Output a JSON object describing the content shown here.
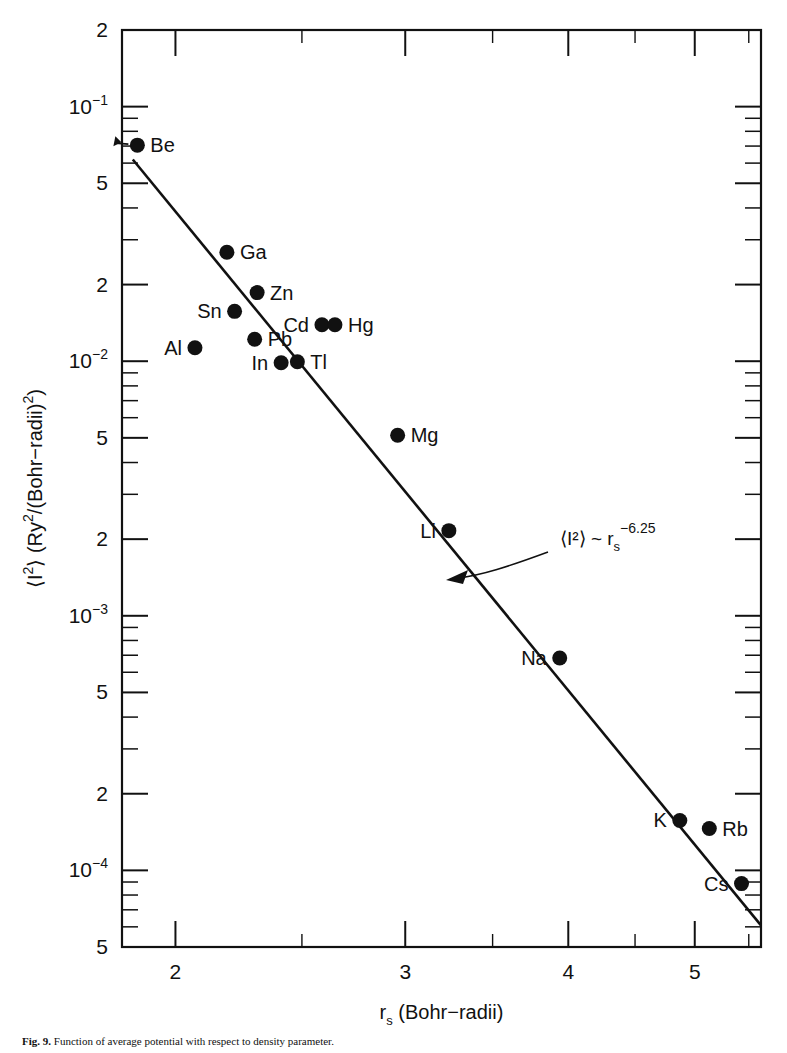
{
  "figure": {
    "caption_prefix": "Fig. 9.",
    "caption_text": "Function of average potential with respect to density parameter."
  },
  "chart_data": {
    "type": "scatter",
    "title": "",
    "xlabel": "r_s  (Bohr-radii)",
    "ylabel": "⟨I²⟩ (Ry²/(Bohr−radii)²)",
    "xscale": "log",
    "yscale": "log",
    "xlim": [
      1.82,
      5.62
    ],
    "ylim": [
      5e-05,
      0.2
    ],
    "grid": false,
    "legend": "none",
    "xtick_labels": [
      "2",
      "3",
      "4",
      "5"
    ],
    "xtick_values": [
      2,
      3,
      4,
      5
    ],
    "ytick_labels": [
      "2",
      "10⁻¹",
      "5",
      "2",
      "10⁻²",
      "5",
      "2",
      "10⁻³",
      "5",
      "2",
      "10⁻⁴",
      "5"
    ],
    "ytick_values": [
      0.2,
      0.1,
      0.05,
      0.02,
      0.01,
      0.005,
      0.002,
      0.001,
      0.0005,
      0.0002,
      0.0001,
      5e-05
    ],
    "annotation": {
      "text_main": "⟨I²⟩ ~ r",
      "text_sub": "s",
      "text_sup": "-6.25",
      "full": "⟨I²⟩ ~ r_s^-6.25"
    },
    "fit_line": {
      "exponent": -6.25,
      "label": "power-law fit"
    },
    "points": [
      {
        "label": "Be",
        "x": 1.87,
        "y": 0.0706,
        "label_side": "right"
      },
      {
        "label": "Ga",
        "x": 2.19,
        "y": 0.0268,
        "label_side": "right"
      },
      {
        "label": "Zn",
        "x": 2.31,
        "y": 0.0186,
        "label_side": "right"
      },
      {
        "label": "Sn",
        "x": 2.22,
        "y": 0.0157,
        "label_side": "left"
      },
      {
        "label": "Cd",
        "x": 2.59,
        "y": 0.0139,
        "label_side": "left"
      },
      {
        "label": "Hg",
        "x": 2.65,
        "y": 0.0139,
        "label_side": "right"
      },
      {
        "label": "Pb",
        "x": 2.3,
        "y": 0.0122,
        "label_side": "right"
      },
      {
        "label": "Al",
        "x": 2.07,
        "y": 0.0113,
        "label_side": "left"
      },
      {
        "label": "In",
        "x": 2.41,
        "y": 0.00986,
        "label_side": "left"
      },
      {
        "label": "Tl",
        "x": 2.48,
        "y": 0.00995,
        "label_side": "right"
      },
      {
        "label": "Mg",
        "x": 2.96,
        "y": 0.00512,
        "label_side": "right"
      },
      {
        "label": "Li",
        "x": 3.24,
        "y": 0.00216,
        "label_side": "left"
      },
      {
        "label": "Na",
        "x": 3.94,
        "y": 0.000683,
        "label_side": "left"
      },
      {
        "label": "K",
        "x": 4.87,
        "y": 0.000157,
        "label_side": "left"
      },
      {
        "label": "Rb",
        "x": 5.13,
        "y": 0.000146,
        "label_side": "right"
      },
      {
        "label": "Cs",
        "x": 5.43,
        "y": 8.87e-05,
        "label_side": "left"
      }
    ]
  }
}
